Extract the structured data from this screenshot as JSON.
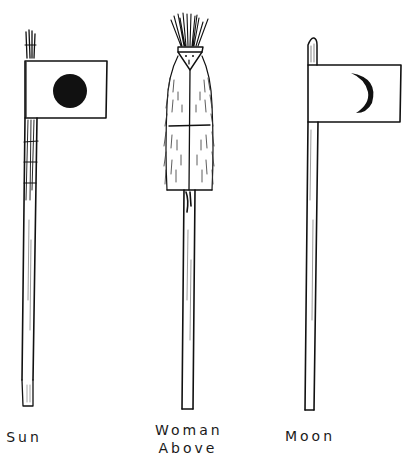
{
  "figures": [
    {
      "id": "sun",
      "label": "Sun",
      "type": "flag-staff",
      "symbol": "solid-disc"
    },
    {
      "id": "woman-above",
      "label_line1": "Woman",
      "label_line2": "Above",
      "type": "figure-staff",
      "symbol": "feathered-headdress figure"
    },
    {
      "id": "moon",
      "label": "Moon",
      "type": "flag-staff",
      "symbol": "crescent"
    }
  ],
  "colors": {
    "ink": "#111111",
    "paper": "#ffffff"
  }
}
